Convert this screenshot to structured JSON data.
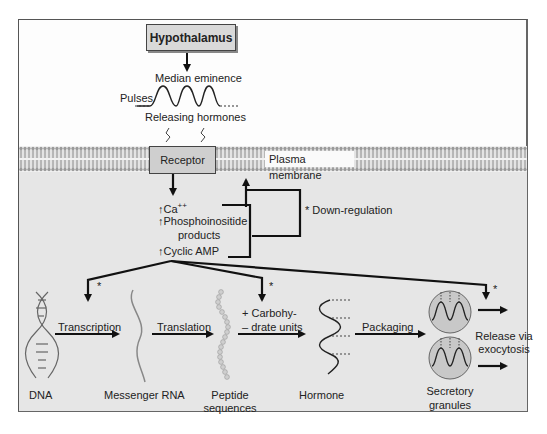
{
  "diagram": {
    "top": {
      "hypothalamus": "Hypothalamus",
      "median_eminence": "Median eminence",
      "pulses": "Pulses",
      "releasing_hormones": "Releasing hormones"
    },
    "membrane": {
      "receptor": "Receptor",
      "plasma_membrane": "Plasma membrane"
    },
    "second_messengers": {
      "ca": "Ca",
      "ca_sup": "++",
      "phospho_1": "Phosphoinositide",
      "phospho_2": "products",
      "camp": "Cyclic AMP",
      "up_arrow": "↑"
    },
    "feedback": {
      "down_regulation": "* Down-regulation"
    },
    "pathway": {
      "asterisk": "*",
      "dna": "DNA",
      "transcription": "Transcription",
      "mrna": "Messenger RNA",
      "translation": "Translation",
      "peptide_1": "Peptide",
      "peptide_2": "sequences",
      "carbo_1": "+ Carbohy-",
      "carbo_2": "– drate units",
      "hormone": "Hormone",
      "packaging": "Packaging",
      "granules_1": "Secretory",
      "granules_2": "granules",
      "release_1": "Release via",
      "release_2": "exocytosis"
    },
    "colors": {
      "upper_bg": "#fdfdfd",
      "lower_bg": "#e6e6e6",
      "box_fill": "#d9d9d9",
      "line": "#111111",
      "membrane": "#b8b8b8"
    }
  }
}
